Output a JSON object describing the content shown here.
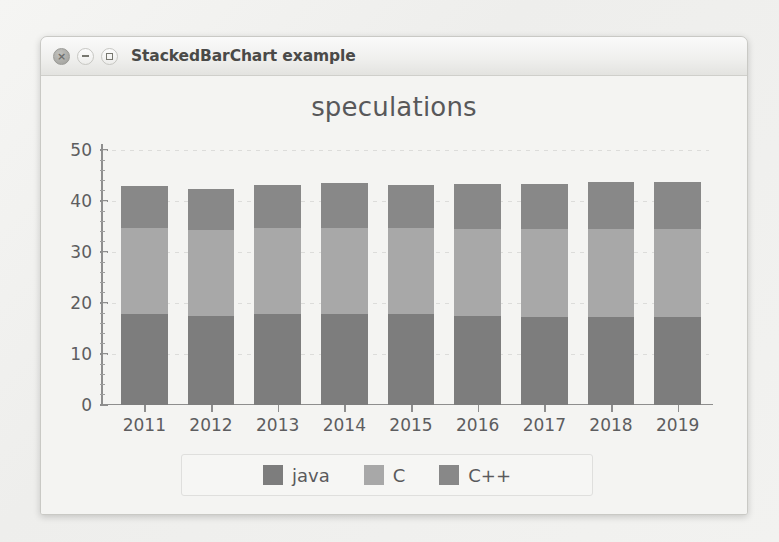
{
  "window": {
    "title": "StackedBarChart example",
    "buttons": [
      {
        "name": "close",
        "glyph": "×"
      },
      {
        "name": "minimize",
        "glyph": "–"
      },
      {
        "name": "maximize",
        "glyph": "□"
      }
    ]
  },
  "chart_data": {
    "type": "bar",
    "stacked": true,
    "title": "speculations",
    "xlabel": "",
    "ylabel": "",
    "categories": [
      "2011",
      "2012",
      "2013",
      "2014",
      "2015",
      "2016",
      "2017",
      "2018",
      "2019"
    ],
    "series": [
      {
        "name": "java",
        "color": "#7d7d7d",
        "values": [
          17.8,
          17.5,
          17.8,
          17.8,
          17.8,
          17.4,
          17.3,
          17.3,
          17.3
        ]
      },
      {
        "name": "C",
        "color": "#a8a8a8",
        "values": [
          16.9,
          16.8,
          16.9,
          17.0,
          16.9,
          17.2,
          17.2,
          17.2,
          17.2
        ]
      },
      {
        "name": "C++",
        "color": "#888888",
        "values": [
          8.3,
          8.0,
          8.4,
          8.7,
          8.5,
          8.7,
          8.8,
          9.2,
          9.2
        ]
      }
    ],
    "ylim": [
      0,
      50
    ],
    "yticks": [
      0,
      10,
      20,
      30,
      40,
      50
    ],
    "yminor_step": 2,
    "grid": true,
    "legend_position": "bottom",
    "legend": [
      "java",
      "C",
      "C++"
    ]
  },
  "colors": {
    "java": "#7d7d7d",
    "c": "#a8a8a8",
    "cpp": "#888888",
    "axis": "#8e8e8e",
    "text": "#5d5d5f"
  }
}
